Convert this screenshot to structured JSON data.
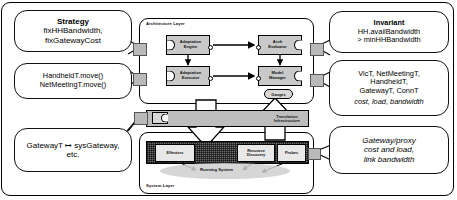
{
  "diagram": {
    "layers": {
      "architecture": {
        "label": "Architecture Layer"
      },
      "translation": {
        "label_line1": "Translation",
        "label_line2": "Infrastructure"
      },
      "system": {
        "label": "System Layer"
      }
    },
    "architecture_components": [
      {
        "id": "adaptation-engine",
        "line1": "Adaptation",
        "line2": "Engine"
      },
      {
        "id": "arch-evaluator",
        "line1": "Arch",
        "line2": "Evaluator"
      },
      {
        "id": "adaptation-executor",
        "line1": "Adaptation",
        "line2": "Executor"
      },
      {
        "id": "model-manager",
        "line1": "Model",
        "line2": "Manager"
      }
    ],
    "gauges": {
      "label": "Gauges"
    },
    "system_components": [
      {
        "id": "effectors",
        "line1": "Effectors",
        "line2": ""
      },
      {
        "id": "resource-discovery",
        "line1": "Resource",
        "line2": "Discovery"
      },
      {
        "id": "probes",
        "line1": "Probes",
        "line2": ""
      }
    ],
    "running_system": {
      "label": "Running System"
    },
    "callouts": [
      {
        "id": "strategy",
        "heading": "Strategy",
        "lines": [
          "fixHHBandwidth,",
          "fixGatewayCost"
        ],
        "italic": false
      },
      {
        "id": "operators",
        "heading": "",
        "lines": [
          "HandheldT.move()",
          "NetMeetingT.move()"
        ],
        "italic": false
      },
      {
        "id": "type-mapping",
        "heading": "",
        "lines": [
          "GatewayT ↦ sysGateway,",
          "etc."
        ],
        "italic": false
      },
      {
        "id": "invariant",
        "heading": "Invariant",
        "lines": [
          "HH.availBandwidth",
          "> minHHBandwidth"
        ],
        "italic": false
      },
      {
        "id": "types-and-properties",
        "heading": "",
        "lines": [
          "VicT, NetMeetingT,",
          "HandheldT,",
          "GatewayT, ConnT",
          "cost, load, bandwidth"
        ],
        "italic": false,
        "italic_last": true
      },
      {
        "id": "system-properties",
        "heading": "",
        "lines": [
          "Gateway/proxy",
          "cost and load,",
          "link bandwidth"
        ],
        "italic": true
      }
    ],
    "colors": {
      "component_fill": "#c9c9c9",
      "translation_band": "#bdbdbd",
      "system_strip": "#6e6e6e",
      "system_component": "#e8e8e8",
      "stroke": "#000000",
      "pad": "#b9b9b9"
    }
  }
}
